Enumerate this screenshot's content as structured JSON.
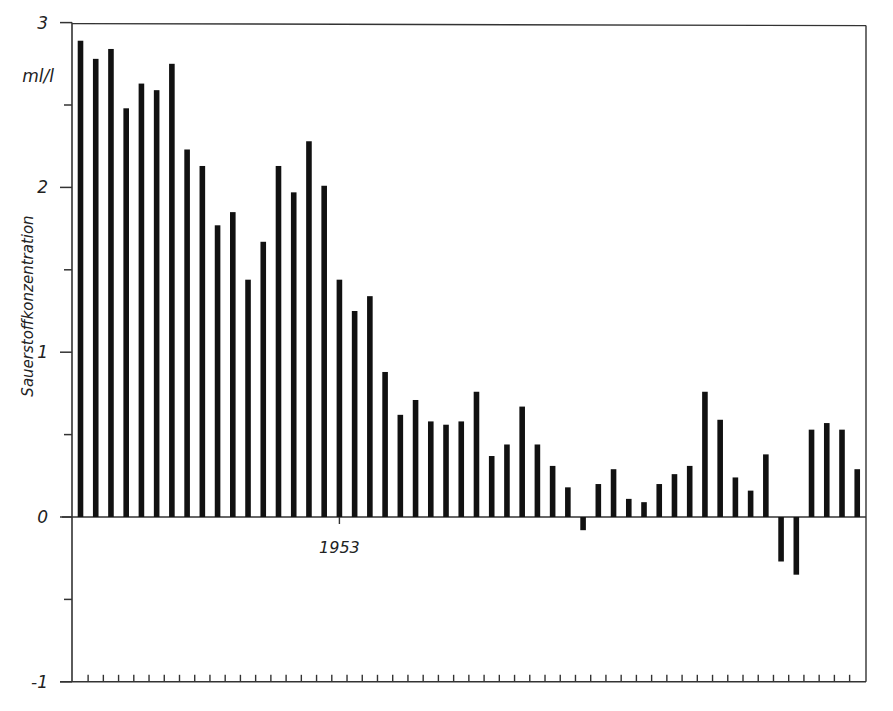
{
  "chart_data": {
    "type": "bar",
    "title": "",
    "xlabel": "",
    "ylabel": "Sauerstoffkonzentration",
    "unit_label": "ml/l",
    "ylim": [
      -1,
      3
    ],
    "yticks": [
      -1,
      0,
      1,
      2,
      3
    ],
    "yticks_minor": [
      -0.5,
      0.5,
      1.5,
      2.5
    ],
    "ytick_labels": [
      "-1",
      "0",
      "1",
      "2",
      "3"
    ],
    "x_annotation": {
      "label": "1953",
      "bar_index": 17
    },
    "grid": false,
    "legend": null,
    "bar_color": "#111111",
    "categories": [
      1936,
      1937,
      1938,
      1939,
      1940,
      1941,
      1942,
      1943,
      1944,
      1945,
      1946,
      1947,
      1948,
      1949,
      1950,
      1951,
      1952,
      1953,
      1954,
      1955,
      1956,
      1957,
      1958,
      1959,
      1960,
      1961,
      1962,
      1963,
      1964,
      1965,
      1966,
      1967,
      1968,
      1969,
      1970,
      1971,
      1972,
      1973,
      1974,
      1975,
      1976,
      1977,
      1978,
      1979,
      1980,
      1981,
      1982,
      1983,
      1984,
      1985,
      1986,
      1987
    ],
    "values": [
      2.89,
      2.78,
      2.84,
      2.48,
      2.63,
      2.59,
      2.75,
      2.23,
      2.13,
      1.77,
      1.85,
      1.44,
      1.67,
      2.13,
      1.97,
      2.28,
      2.01,
      1.44,
      1.25,
      1.34,
      0.88,
      0.62,
      0.71,
      0.58,
      0.56,
      0.58,
      0.76,
      0.37,
      0.44,
      0.67,
      0.44,
      0.31,
      0.18,
      -0.08,
      0.2,
      0.29,
      0.11,
      0.09,
      0.2,
      0.26,
      0.31,
      0.76,
      0.59,
      0.24,
      0.16,
      0.38,
      -0.27,
      -0.35,
      0.53,
      0.57,
      0.53,
      0.29
    ]
  }
}
